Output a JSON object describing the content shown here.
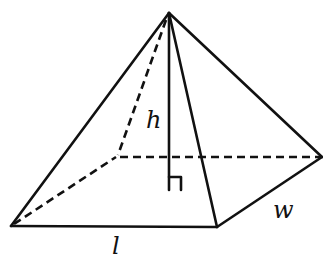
{
  "figure": {
    "labels": {
      "height": "h",
      "length": "l",
      "width": "w"
    },
    "vertices": {
      "apex": [
        169,
        13
      ],
      "front_left": [
        11,
        226
      ],
      "front_right": [
        217,
        227
      ],
      "back_right": [
        322,
        157
      ],
      "back_left": [
        116,
        157
      ],
      "height_foot": [
        169,
        190
      ]
    },
    "edges": {
      "visible": [
        "apex-front_left",
        "apex-front_right",
        "apex-back_right",
        "front_left-front_right",
        "front_right-back_right",
        "apex-height_foot"
      ],
      "hidden": [
        "apex-back_left",
        "front_left-back_left",
        "back_left-back_right"
      ]
    },
    "right_angle_marker": true
  }
}
